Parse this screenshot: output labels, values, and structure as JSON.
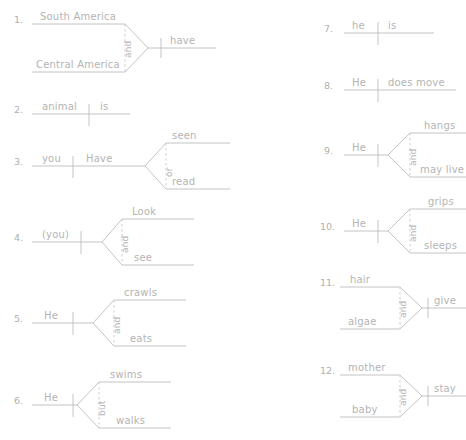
{
  "page": {
    "line_color": "#bdbdbd",
    "text_color": "#b4b4b4",
    "background": "#ffffff",
    "dash_color": "#c9c9c9"
  },
  "diagrams": [
    {
      "number": "1.",
      "type": "compound-subject",
      "subjects": [
        "South America",
        "Central America"
      ],
      "conjunction": "and",
      "predicate": "have"
    },
    {
      "number": "2.",
      "type": "simple",
      "subject": "animal",
      "predicate": "is"
    },
    {
      "number": "3.",
      "type": "compound-predicate",
      "subject": "you",
      "verb": "Have",
      "conjunction": "or",
      "predicates": [
        "seen",
        "read"
      ]
    },
    {
      "number": "4.",
      "type": "compound-predicate",
      "subject": "(you)",
      "verb": "",
      "conjunction": "and",
      "predicates": [
        "Look",
        "see"
      ]
    },
    {
      "number": "5.",
      "type": "compound-predicate",
      "subject": "He",
      "verb": "",
      "conjunction": "and",
      "predicates": [
        "crawls",
        "eats"
      ]
    },
    {
      "number": "6.",
      "type": "compound-predicate",
      "subject": "He",
      "verb": "",
      "conjunction": "but",
      "predicates": [
        "swims",
        "walks"
      ]
    },
    {
      "number": "7.",
      "type": "simple",
      "subject": "he",
      "predicate": "is"
    },
    {
      "number": "8.",
      "type": "simple",
      "subject": "He",
      "predicate": "does move"
    },
    {
      "number": "9.",
      "type": "compound-predicate",
      "subject": "He",
      "verb": "",
      "conjunction": "and",
      "predicates": [
        "hangs",
        "may live"
      ]
    },
    {
      "number": "10.",
      "type": "compound-predicate",
      "subject": "He",
      "verb": "",
      "conjunction": "and",
      "predicates": [
        "grips",
        "sleeps"
      ]
    },
    {
      "number": "11.",
      "type": "compound-subject",
      "subjects": [
        "hair",
        "algae"
      ],
      "conjunction": "and",
      "predicate": "give"
    },
    {
      "number": "12.",
      "type": "compound-subject",
      "subjects": [
        "mother",
        "baby"
      ],
      "conjunction": "and",
      "predicate": "stay"
    }
  ]
}
